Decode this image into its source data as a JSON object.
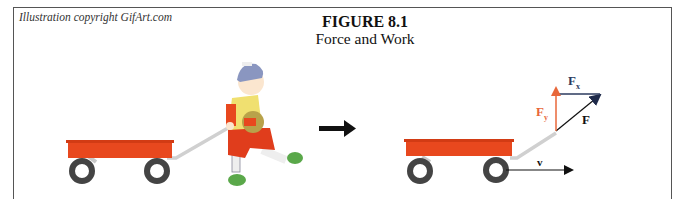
{
  "header": {
    "credit": "Illustration copyright GifArt.com",
    "title": "FIGURE 8.1",
    "subtitle": "Force and Work"
  },
  "left_scene": {
    "description": "Child walking while pulling a red wagon by its handle",
    "wagon_color": "#e8481e",
    "wheel_color": "#444444"
  },
  "transition_arrow": {
    "direction": "right",
    "color": "#111111"
  },
  "right_scene": {
    "wagon_color": "#e8481e",
    "vectors": [
      {
        "id": "F",
        "label": "F",
        "color": "#111111",
        "direction": "diagonal up-right"
      },
      {
        "id": "Fx",
        "label": "F",
        "subscript": "x",
        "color": "#2b3a5e",
        "direction": "horizontal right"
      },
      {
        "id": "Fy",
        "label": "F",
        "subscript": "y",
        "color": "#e8673a",
        "direction": "vertical up"
      },
      {
        "id": "v",
        "label": "v",
        "color": "#111111",
        "direction": "horizontal right"
      }
    ]
  }
}
